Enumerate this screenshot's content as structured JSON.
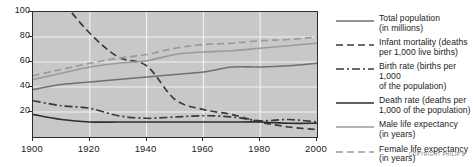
{
  "chart_data": {
    "type": "line",
    "title": "",
    "xlabel": "",
    "ylabel": "",
    "xlim": [
      1900,
      2000
    ],
    "ylim": [
      0,
      100
    ],
    "grid": true,
    "legend_position": "right",
    "plot_background": "#c8c8c8",
    "x_ticks": [
      "1900",
      "1920",
      "1940",
      "1960",
      "1980",
      "2000"
    ],
    "y_ticks": [
      "20",
      "40",
      "60",
      "80",
      "100"
    ],
    "x": [
      1900,
      1910,
      1920,
      1930,
      1940,
      1950,
      1960,
      1970,
      1980,
      1990,
      2000
    ],
    "series": [
      {
        "name": "Total population (in millions)",
        "style": "solid",
        "color": "#707070",
        "values": [
          38,
          42,
          44,
          46,
          48,
          50,
          52,
          56,
          56,
          57,
          59
        ]
      },
      {
        "name": "Infant mortality (deaths per 1,000 live births)",
        "style": "dashed",
        "color": "#3a3a3a",
        "values": [
          142,
          110,
          83,
          64,
          57,
          30,
          22,
          18,
          12,
          8,
          6
        ]
      },
      {
        "name": "Birth rate (births per 1,000 of the population)",
        "style": "dash-dot",
        "color": "#3a3a3a",
        "values": [
          29,
          25,
          23,
          17,
          15,
          16,
          17,
          16,
          13,
          14,
          12
        ]
      },
      {
        "name": "Death rate (deaths per 1,000 of the population)",
        "style": "solid",
        "color": "#2d2d2d",
        "values": [
          18,
          14,
          12,
          12,
          12,
          12,
          12,
          12,
          12,
          11,
          11
        ]
      },
      {
        "name": "Male life expectancy (in years)",
        "style": "solid",
        "color": "#9a9a9a",
        "values": [
          46,
          51,
          56,
          59,
          61,
          66,
          68,
          69,
          71,
          73,
          75
        ]
      },
      {
        "name": "Female life expectancy (in years)",
        "style": "dashed",
        "color": "#9a9a9a",
        "values": [
          49,
          54,
          59,
          63,
          66,
          71,
          74,
          75,
          77,
          78,
          80
        ]
      }
    ]
  },
  "legend": {
    "items": [
      {
        "label": "Total population\n(in millions)",
        "style": "solid",
        "color": "#707070"
      },
      {
        "label": "Infant mortality (deaths\nper 1,000 live births)",
        "style": "dashed",
        "color": "#3a3a3a"
      },
      {
        "label": "Birth rate (births per 1,000\nof the population)",
        "style": "dash-dot",
        "color": "#3a3a3a"
      },
      {
        "label": "Death rate (deaths per\n1,000 of the population)",
        "style": "solid",
        "color": "#2d2d2d"
      },
      {
        "label": "Male life expectancy\n(in years)",
        "style": "solid",
        "color": "#9a9a9a"
      },
      {
        "label": "Female life expectancy\n(in years)",
        "style": "dashed",
        "color": "#9a9a9a"
      }
    ]
  },
  "footer": {
    "copyright": "Copyright Philip's"
  }
}
